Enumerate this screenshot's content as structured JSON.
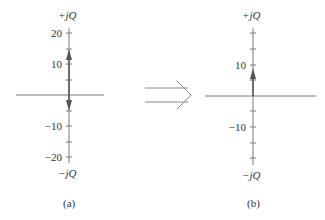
{
  "panels": [
    {
      "id": "a",
      "caption": "(a)",
      "axis_top_label": "+jQ",
      "axis_bottom_label": "−jQ",
      "tick_labels": {
        "p20": "20",
        "p10": "10",
        "m10": "−10",
        "m20": "−20"
      },
      "arrows": [
        "up to ~+13",
        "down to ~−5"
      ]
    },
    {
      "id": "b",
      "caption": "(b)",
      "axis_top_label": "+jQ",
      "axis_bottom_label": "−jQ",
      "tick_labels": {
        "p10": "10",
        "m10": "−10"
      },
      "arrows": [
        "up to ~+8"
      ]
    }
  ],
  "transition_arrow": "double-line right arrow",
  "colors": {
    "axis": "#7a7a7a",
    "arrow": "#555555",
    "text": "#333333"
  }
}
